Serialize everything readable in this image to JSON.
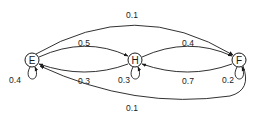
{
  "diagram": {
    "type": "state-transition",
    "nodes": [
      {
        "id": "E",
        "label": "E"
      },
      {
        "id": "H",
        "label": "H"
      },
      {
        "id": "F",
        "label": "F"
      }
    ],
    "edges": [
      {
        "from": "E",
        "to": "F",
        "label": "0.1"
      },
      {
        "from": "E",
        "to": "H",
        "label": "0.5"
      },
      {
        "from": "H",
        "to": "F",
        "label": "0.4"
      },
      {
        "from": "H",
        "to": "E",
        "label": "0.3"
      },
      {
        "from": "F",
        "to": "H",
        "label": "0.7"
      },
      {
        "from": "F",
        "to": "E",
        "label": "0.1"
      },
      {
        "from": "E",
        "to": "E",
        "label": "0.4"
      },
      {
        "from": "H",
        "to": "H",
        "label": "0.3"
      },
      {
        "from": "F",
        "to": "F",
        "label": "0.2"
      }
    ]
  }
}
